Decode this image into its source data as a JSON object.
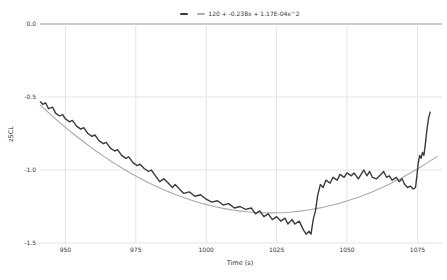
{
  "chart_data": {
    "type": "line",
    "title": "",
    "xlabel": "Time (s)",
    "ylabel": "zSCL",
    "xlim": [
      941,
      1083
    ],
    "ylim": [
      -1.5,
      0
    ],
    "x_ticks": [
      950,
      975,
      1000,
      1025,
      1050,
      1075
    ],
    "x_tick_labels": [
      "950",
      "975",
      "1000",
      "1025",
      "1050",
      "1075"
    ],
    "y_ticks": [
      0.0,
      -0.5,
      -1.0,
      -1.5
    ],
    "y_tick_labels": [
      "0.0",
      "-0.5",
      "-1.0",
      "-1.5"
    ],
    "grid": true,
    "legend_position": "top-center",
    "series": [
      {
        "name": "",
        "color": "#3b3b3b",
        "width": 1.4,
        "points": [
          [
            941.0,
            -0.53
          ],
          [
            942.0,
            -0.55
          ],
          [
            943.0,
            -0.54
          ],
          [
            944.0,
            -0.58
          ],
          [
            945.5,
            -0.57
          ],
          [
            946.5,
            -0.61
          ],
          [
            948.0,
            -0.63
          ],
          [
            949.0,
            -0.62
          ],
          [
            950.0,
            -0.65
          ],
          [
            951.5,
            -0.67
          ],
          [
            952.5,
            -0.66
          ],
          [
            954.0,
            -0.7
          ],
          [
            955.5,
            -0.72
          ],
          [
            956.5,
            -0.71
          ],
          [
            958.0,
            -0.75
          ],
          [
            959.5,
            -0.77
          ],
          [
            960.5,
            -0.76
          ],
          [
            962.0,
            -0.8
          ],
          [
            963.5,
            -0.82
          ],
          [
            964.5,
            -0.81
          ],
          [
            966.0,
            -0.85
          ],
          [
            967.5,
            -0.87
          ],
          [
            968.5,
            -0.86
          ],
          [
            970.0,
            -0.9
          ],
          [
            971.5,
            -0.92
          ],
          [
            972.5,
            -0.91
          ],
          [
            974.0,
            -0.95
          ],
          [
            975.5,
            -0.97
          ],
          [
            976.5,
            -0.96
          ],
          [
            978.0,
            -0.99
          ],
          [
            979.5,
            -1.01
          ],
          [
            980.5,
            -1.0
          ],
          [
            982.0,
            -1.04
          ],
          [
            983.5,
            -1.08
          ],
          [
            985.0,
            -1.06
          ],
          [
            986.5,
            -1.09
          ],
          [
            988.0,
            -1.12
          ],
          [
            989.0,
            -1.1
          ],
          [
            990.5,
            -1.13
          ],
          [
            992.0,
            -1.16
          ],
          [
            994.0,
            -1.15
          ],
          [
            996.0,
            -1.18
          ],
          [
            998.0,
            -1.17
          ],
          [
            1000.0,
            -1.2
          ],
          [
            1002.0,
            -1.22
          ],
          [
            1004.0,
            -1.21
          ],
          [
            1006.0,
            -1.24
          ],
          [
            1008.0,
            -1.23
          ],
          [
            1010.0,
            -1.26
          ],
          [
            1012.0,
            -1.25
          ],
          [
            1014.0,
            -1.27
          ],
          [
            1016.0,
            -1.26
          ],
          [
            1017.5,
            -1.3
          ],
          [
            1019.0,
            -1.28
          ],
          [
            1020.5,
            -1.32
          ],
          [
            1022.0,
            -1.3
          ],
          [
            1023.5,
            -1.34
          ],
          [
            1025.0,
            -1.32
          ],
          [
            1026.5,
            -1.35
          ],
          [
            1028.0,
            -1.33
          ],
          [
            1029.0,
            -1.37
          ],
          [
            1030.5,
            -1.34
          ],
          [
            1031.5,
            -1.37
          ],
          [
            1033.0,
            -1.35
          ],
          [
            1034.5,
            -1.41
          ],
          [
            1035.5,
            -1.44
          ],
          [
            1036.5,
            -1.42
          ],
          [
            1037.2,
            -1.44
          ],
          [
            1038.0,
            -1.34
          ],
          [
            1038.8,
            -1.28
          ],
          [
            1039.5,
            -1.18
          ],
          [
            1040.5,
            -1.1
          ],
          [
            1041.5,
            -1.12
          ],
          [
            1042.5,
            -1.07
          ],
          [
            1044.0,
            -1.09
          ],
          [
            1045.0,
            -1.05
          ],
          [
            1046.5,
            -1.07
          ],
          [
            1047.5,
            -1.03
          ],
          [
            1049.0,
            -1.05
          ],
          [
            1050.0,
            -1.02
          ],
          [
            1051.5,
            -1.04
          ],
          [
            1052.5,
            -1.02
          ],
          [
            1054.0,
            -1.06
          ],
          [
            1055.0,
            -1.03
          ],
          [
            1056.0,
            -1.0
          ],
          [
            1057.0,
            -1.04
          ],
          [
            1058.0,
            -1.01
          ],
          [
            1059.0,
            -1.05
          ],
          [
            1060.5,
            -1.06
          ],
          [
            1062.0,
            -1.03
          ],
          [
            1063.0,
            -1.01
          ],
          [
            1064.0,
            -1.05
          ],
          [
            1065.0,
            -1.04
          ],
          [
            1066.0,
            -1.07
          ],
          [
            1067.5,
            -1.05
          ],
          [
            1068.5,
            -1.08
          ],
          [
            1069.5,
            -1.06
          ],
          [
            1070.5,
            -1.1
          ],
          [
            1071.5,
            -1.12
          ],
          [
            1072.5,
            -1.11
          ],
          [
            1073.5,
            -1.13
          ],
          [
            1074.3,
            -1.12
          ],
          [
            1074.8,
            -1.04
          ],
          [
            1075.3,
            -0.95
          ],
          [
            1075.8,
            -0.9
          ],
          [
            1076.3,
            -0.92
          ],
          [
            1076.8,
            -0.88
          ],
          [
            1077.3,
            -0.9
          ],
          [
            1077.8,
            -0.82
          ],
          [
            1078.4,
            -0.72
          ],
          [
            1079.0,
            -0.64
          ],
          [
            1079.6,
            -0.6
          ]
        ]
      }
    ],
    "fit": {
      "name": "120 + -0.238x + 1.17E-04x^2",
      "color": "#a9a9a9",
      "width": 1.1,
      "quadratic": {
        "a": 0.0001107,
        "vertex_x": 1022.8,
        "vertex_y": -1.294
      },
      "x_range": [
        941,
        1082
      ]
    }
  },
  "legend": {
    "items": [
      {
        "label": "",
        "color": "#3b3b3b",
        "thickness": 2
      },
      {
        "label": "120 + -0.238x + 1.17E-04x^2",
        "color": "#a9a9a9",
        "thickness": 1.5
      }
    ]
  },
  "colors": {
    "background": "#ffffff",
    "grid": "#e4e4e4",
    "zero_line": "#9a9a9a",
    "tick_text": "#333333"
  }
}
